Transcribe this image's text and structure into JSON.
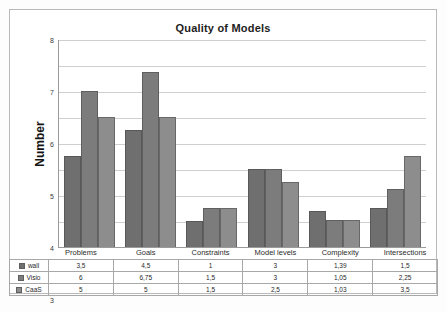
{
  "chart_data": {
    "type": "bar",
    "title": "Quality of Models",
    "xlabel": "",
    "ylabel": "Number",
    "ylim": [
      0,
      8
    ],
    "yticks": [
      "0",
      "1",
      "2",
      "3",
      "4",
      "5",
      "6",
      "7",
      "8"
    ],
    "grid": true,
    "legend_position": "data-table",
    "categories": [
      "Problems",
      "Goals",
      "Constraints",
      "Model levels",
      "Complexity",
      "Intersections"
    ],
    "series": [
      {
        "name": "wall",
        "color": "#6f6f6f",
        "values": [
          3.5,
          4.5,
          1,
          3,
          1.39,
          1.5
        ],
        "labels": [
          "3,5",
          "4,5",
          "1",
          "3",
          "1,39",
          "1,5"
        ]
      },
      {
        "name": "Visio",
        "color": "#7c7c7c",
        "values": [
          6,
          6.75,
          1.5,
          3,
          1.05,
          2.25
        ],
        "labels": [
          "6",
          "6,75",
          "1,5",
          "3",
          "1,05",
          "2,25"
        ]
      },
      {
        "name": "CaaS",
        "color": "#8d8d8d",
        "values": [
          5,
          5,
          1.5,
          2.5,
          1.03,
          3.5
        ],
        "labels": [
          "5",
          "5",
          "1,5",
          "2,5",
          "1,03",
          "3,5"
        ]
      }
    ]
  },
  "caption": ""
}
